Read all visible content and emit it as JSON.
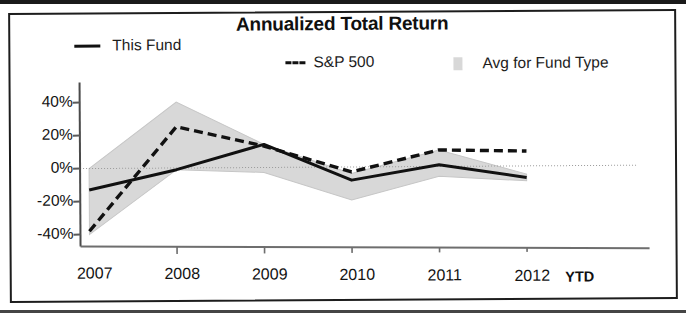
{
  "chart_data": {
    "type": "line",
    "title": "Annualized Total Return",
    "xlabel": "",
    "ylabel": "",
    "categories": [
      "2007",
      "2008",
      "2009",
      "2010",
      "2011",
      "2012"
    ],
    "x_axis_suffix_label": "YTD",
    "x_tick_labels": [
      "2007",
      "2008",
      "2009",
      "2010",
      "2011",
      "2012"
    ],
    "y_tick_labels": [
      "40%",
      "20%",
      "0%",
      "-20%",
      "-40%"
    ],
    "y_tick_values": [
      40,
      20,
      0,
      -20,
      -40
    ],
    "ylim": [
      -45,
      45
    ],
    "grid": false,
    "zero_line": true,
    "legend_position": "top",
    "series": [
      {
        "name": "This Fund",
        "style": "solid",
        "color": "#111111",
        "values": [
          -13,
          -1,
          14,
          -8,
          1,
          -7
        ]
      },
      {
        "name": "S&P 500",
        "style": "dashed",
        "color": "#111111",
        "values": [
          -38,
          25,
          13,
          -3,
          10,
          9
        ]
      }
    ],
    "band": {
      "name": "Avg for Fund Type",
      "style": "shaded-range",
      "color": "#d8d8d8",
      "upper": [
        0,
        40,
        14,
        -4,
        10,
        -5
      ],
      "lower": [
        -40,
        -1,
        -3,
        -20,
        -6,
        -9
      ]
    },
    "annotations": []
  },
  "chart": {
    "title": "Annualized Total Return",
    "legend": [
      {
        "label": "This Fund",
        "marker": "solid-line-swatch"
      },
      {
        "label": "S&P 500",
        "marker": "dashed-line-swatch"
      },
      {
        "label": "Avg for Fund Type",
        "marker": "gray-square-swatch"
      }
    ],
    "y_axis": {
      "ticks": [
        {
          "label": "40%"
        },
        {
          "label": "20%"
        },
        {
          "label": "0%"
        },
        {
          "label": "-20%"
        },
        {
          "label": "-40%"
        }
      ]
    },
    "x_axis": {
      "ticks": [
        {
          "label": "2007"
        },
        {
          "label": "2008"
        },
        {
          "label": "2009"
        },
        {
          "label": "2010"
        },
        {
          "label": "2011"
        },
        {
          "label": "2012"
        }
      ],
      "suffix": "YTD"
    }
  }
}
